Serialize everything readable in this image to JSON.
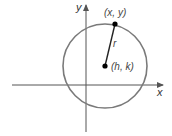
{
  "diagram": {
    "axes": {
      "x_label": "x",
      "y_label": "y"
    },
    "point_on_circle_label": "(x, y)",
    "center_label": "(h, k)",
    "radius_label": "r",
    "colors": {
      "circle": "#7a7a7a",
      "axes": "#555555",
      "points": "#000000",
      "radius": "#222222"
    }
  }
}
